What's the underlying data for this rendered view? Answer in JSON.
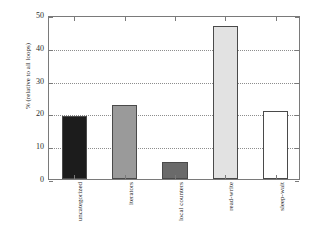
{
  "chart_data": {
    "type": "bar",
    "title": "",
    "subtitle": "",
    "xlabel": "",
    "ylabel": "% (relative to all loops)",
    "categories": [
      "uncategorized",
      "iterators",
      "local counters",
      "read-write",
      "sleep-wait"
    ],
    "values": [
      19.1,
      22.5,
      5.2,
      46.7,
      20.8
    ],
    "bar_colors": [
      "#1c1c1c",
      "#9a9a9a",
      "#6a6a6a",
      "#e2e2e2",
      "#ffffff"
    ],
    "ylim": [
      0,
      50
    ],
    "yticks": [
      0,
      10,
      20,
      30,
      40,
      50
    ],
    "ytick_labels": [
      "0",
      "10",
      "20",
      "30",
      "40",
      "50"
    ],
    "gridlines": [
      10,
      20,
      30,
      40
    ],
    "grid": true,
    "legend": "none",
    "axis_color": "#7a7a7a",
    "grid_color": "#8d8d8d",
    "bar_edge_color": "#4a4a4a"
  }
}
